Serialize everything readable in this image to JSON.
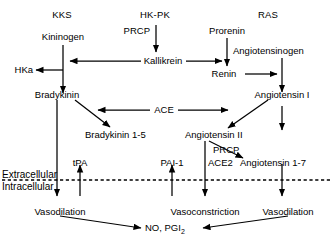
{
  "diagram": {
    "line_color": "#000000",
    "background_color": "#ffffff",
    "headers": [
      {
        "id": "kks",
        "label": "KKS"
      },
      {
        "id": "hkpk",
        "label": "HK-PK"
      },
      {
        "id": "ras",
        "label": "RAS"
      }
    ],
    "nodes": [
      {
        "id": "kininogen",
        "label": "Kininogen"
      },
      {
        "id": "prcp_top",
        "label": "PRCP"
      },
      {
        "id": "prorenin",
        "label": "Prorenin"
      },
      {
        "id": "angiotensinogen",
        "label": "Angiotensinogen"
      },
      {
        "id": "hka",
        "label": "HKa"
      },
      {
        "id": "kallikrein",
        "label": "Kallikrein"
      },
      {
        "id": "renin",
        "label": "Renin"
      },
      {
        "id": "bradykinin",
        "label": "Bradykinin"
      },
      {
        "id": "ace",
        "label": "ACE"
      },
      {
        "id": "angiotensin_i",
        "label": "Angiotensin I"
      },
      {
        "id": "bradykinin_1_5",
        "label": "Bradykinin 1-5"
      },
      {
        "id": "angiotensin_ii",
        "label": "Angiotensin II"
      },
      {
        "id": "prcp_mid",
        "label": "PRCP"
      },
      {
        "id": "tpa",
        "label": "tPA"
      },
      {
        "id": "pai1",
        "label": "PAI-1"
      },
      {
        "id": "ace2",
        "label": "ACE2"
      },
      {
        "id": "angiotensin_1_7",
        "label": "Angiotensin 1-7"
      },
      {
        "id": "vasodilation_left",
        "label": "Vasodilation"
      },
      {
        "id": "vasoconstriction",
        "label": "Vasoconstriction"
      },
      {
        "id": "vasodilation_right",
        "label": "Vasodilation"
      }
    ],
    "membrane": {
      "extracellular_label": "Extracellular",
      "intracellular_label": "Intracellular"
    },
    "output": {
      "label_main": "NO, PGI",
      "label_sub": "2"
    }
  }
}
